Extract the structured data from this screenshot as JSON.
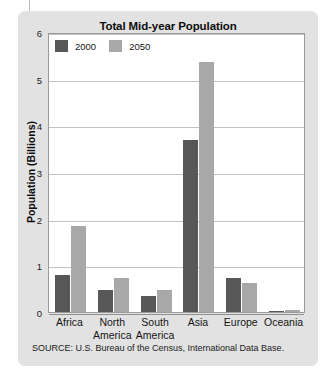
{
  "chart_data": {
    "type": "bar",
    "title": "Total Mid-year Population",
    "xlabel": "",
    "ylabel": "Population (Billions)",
    "categories": [
      "Africa",
      "North America",
      "South America",
      "Asia",
      "Europe",
      "Oceania"
    ],
    "series": [
      {
        "name": "2000",
        "color": "#575757",
        "values": [
          0.8,
          0.47,
          0.35,
          3.68,
          0.73,
          0.03
        ]
      },
      {
        "name": "2050",
        "color": "#a8a8a8",
        "values": [
          1.85,
          0.72,
          0.47,
          5.35,
          0.63,
          0.05
        ]
      }
    ],
    "ylim": [
      0,
      6
    ],
    "yticks": [
      0,
      1,
      2,
      3,
      4,
      5,
      6
    ],
    "ytick_labels": [
      "0",
      "1",
      "2",
      "3",
      "4",
      "5",
      "6"
    ],
    "grid": true,
    "legend_position": "top-left",
    "source": "SOURCE: U.S. Bureau of the Census, International Data Base."
  },
  "colors": {
    "card_background": "#e2e2e2",
    "plot_background": "#ffffff",
    "gridline": "#c2c2c2",
    "axis": "#8f8f8f",
    "text": "#141414"
  }
}
